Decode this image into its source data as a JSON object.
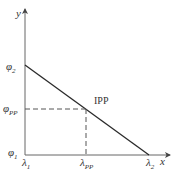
{
  "diagram": {
    "axes": {
      "x_label": "x",
      "y_label": "y"
    },
    "y_ticks": [
      {
        "symbol": "φ",
        "sub": "2"
      },
      {
        "symbol": "φ",
        "sub": "PP"
      },
      {
        "symbol": "φ",
        "sub": "1"
      }
    ],
    "x_ticks": [
      {
        "symbol": "λ",
        "sub": "1"
      },
      {
        "symbol": "λ",
        "sub": "PP"
      },
      {
        "symbol": "λ",
        "sub": "2"
      }
    ],
    "point_label": "IPP",
    "colors": {
      "line": "#2a2a2a",
      "axis": "#555555",
      "dashed": "#555555"
    }
  }
}
